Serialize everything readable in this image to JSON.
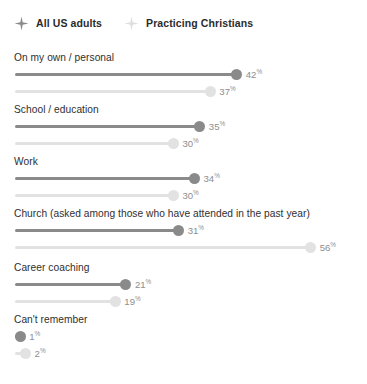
{
  "legend": {
    "items": [
      {
        "label": "All US adults",
        "icon": "sparkle-icon",
        "color": "#8a8a8a"
      },
      {
        "label": "Practicing Christians",
        "icon": "sparkle-icon",
        "color": "#dedede"
      }
    ]
  },
  "colors": {
    "series_all_us_adults": "#8a8a8a",
    "series_practicing_christians": "#e2e2e2",
    "group_label": "#2f2f2f",
    "value_label": "#8e8e8e",
    "background": "#ffffff"
  },
  "chart_data": {
    "type": "bar",
    "title": "",
    "subtitle": "",
    "xlabel": "",
    "ylabel": "",
    "xlim": [
      0,
      60
    ],
    "grid": false,
    "legend_position": "top-left",
    "orientation": "horizontal",
    "value_suffix": "%",
    "categories": [
      "On my own / personal",
      "School / education",
      "Work",
      "Church (asked among those who have attended in the past year)",
      "Career coaching",
      "Can't remember"
    ],
    "series": [
      {
        "name": "All US adults",
        "values": [
          42,
          35,
          34,
          31,
          21,
          1
        ],
        "labels": [
          "42",
          "35",
          "34",
          "31",
          "21",
          "1"
        ]
      },
      {
        "name": "Practicing Christians",
        "values": [
          37,
          30,
          30,
          56,
          19,
          2
        ],
        "labels": [
          "37",
          "30",
          "30",
          "56",
          "19",
          "2"
        ]
      }
    ]
  }
}
